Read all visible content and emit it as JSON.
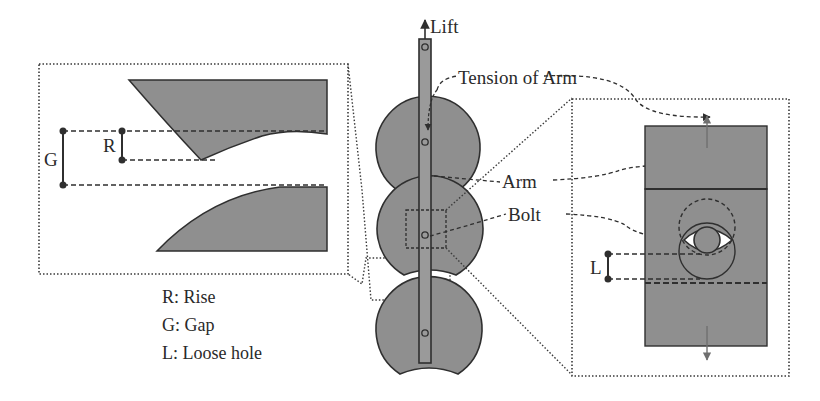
{
  "figure": {
    "fill_color": "#8f8f8f",
    "stroke_color": "#2f2f2f",
    "background": "#ffffff"
  },
  "labels": {
    "lift": "Lift",
    "tension_of_arm": "Tension of Arm",
    "arm": "Arm",
    "bolt": "Bolt"
  },
  "detail_left": {
    "dim_g": "G",
    "dim_r": "R"
  },
  "detail_right": {
    "dim_l": "L"
  },
  "legend": {
    "items": [
      {
        "label": "R: Rise"
      },
      {
        "label": "G: Gap"
      },
      {
        "label": "L: Loose hole"
      }
    ]
  }
}
